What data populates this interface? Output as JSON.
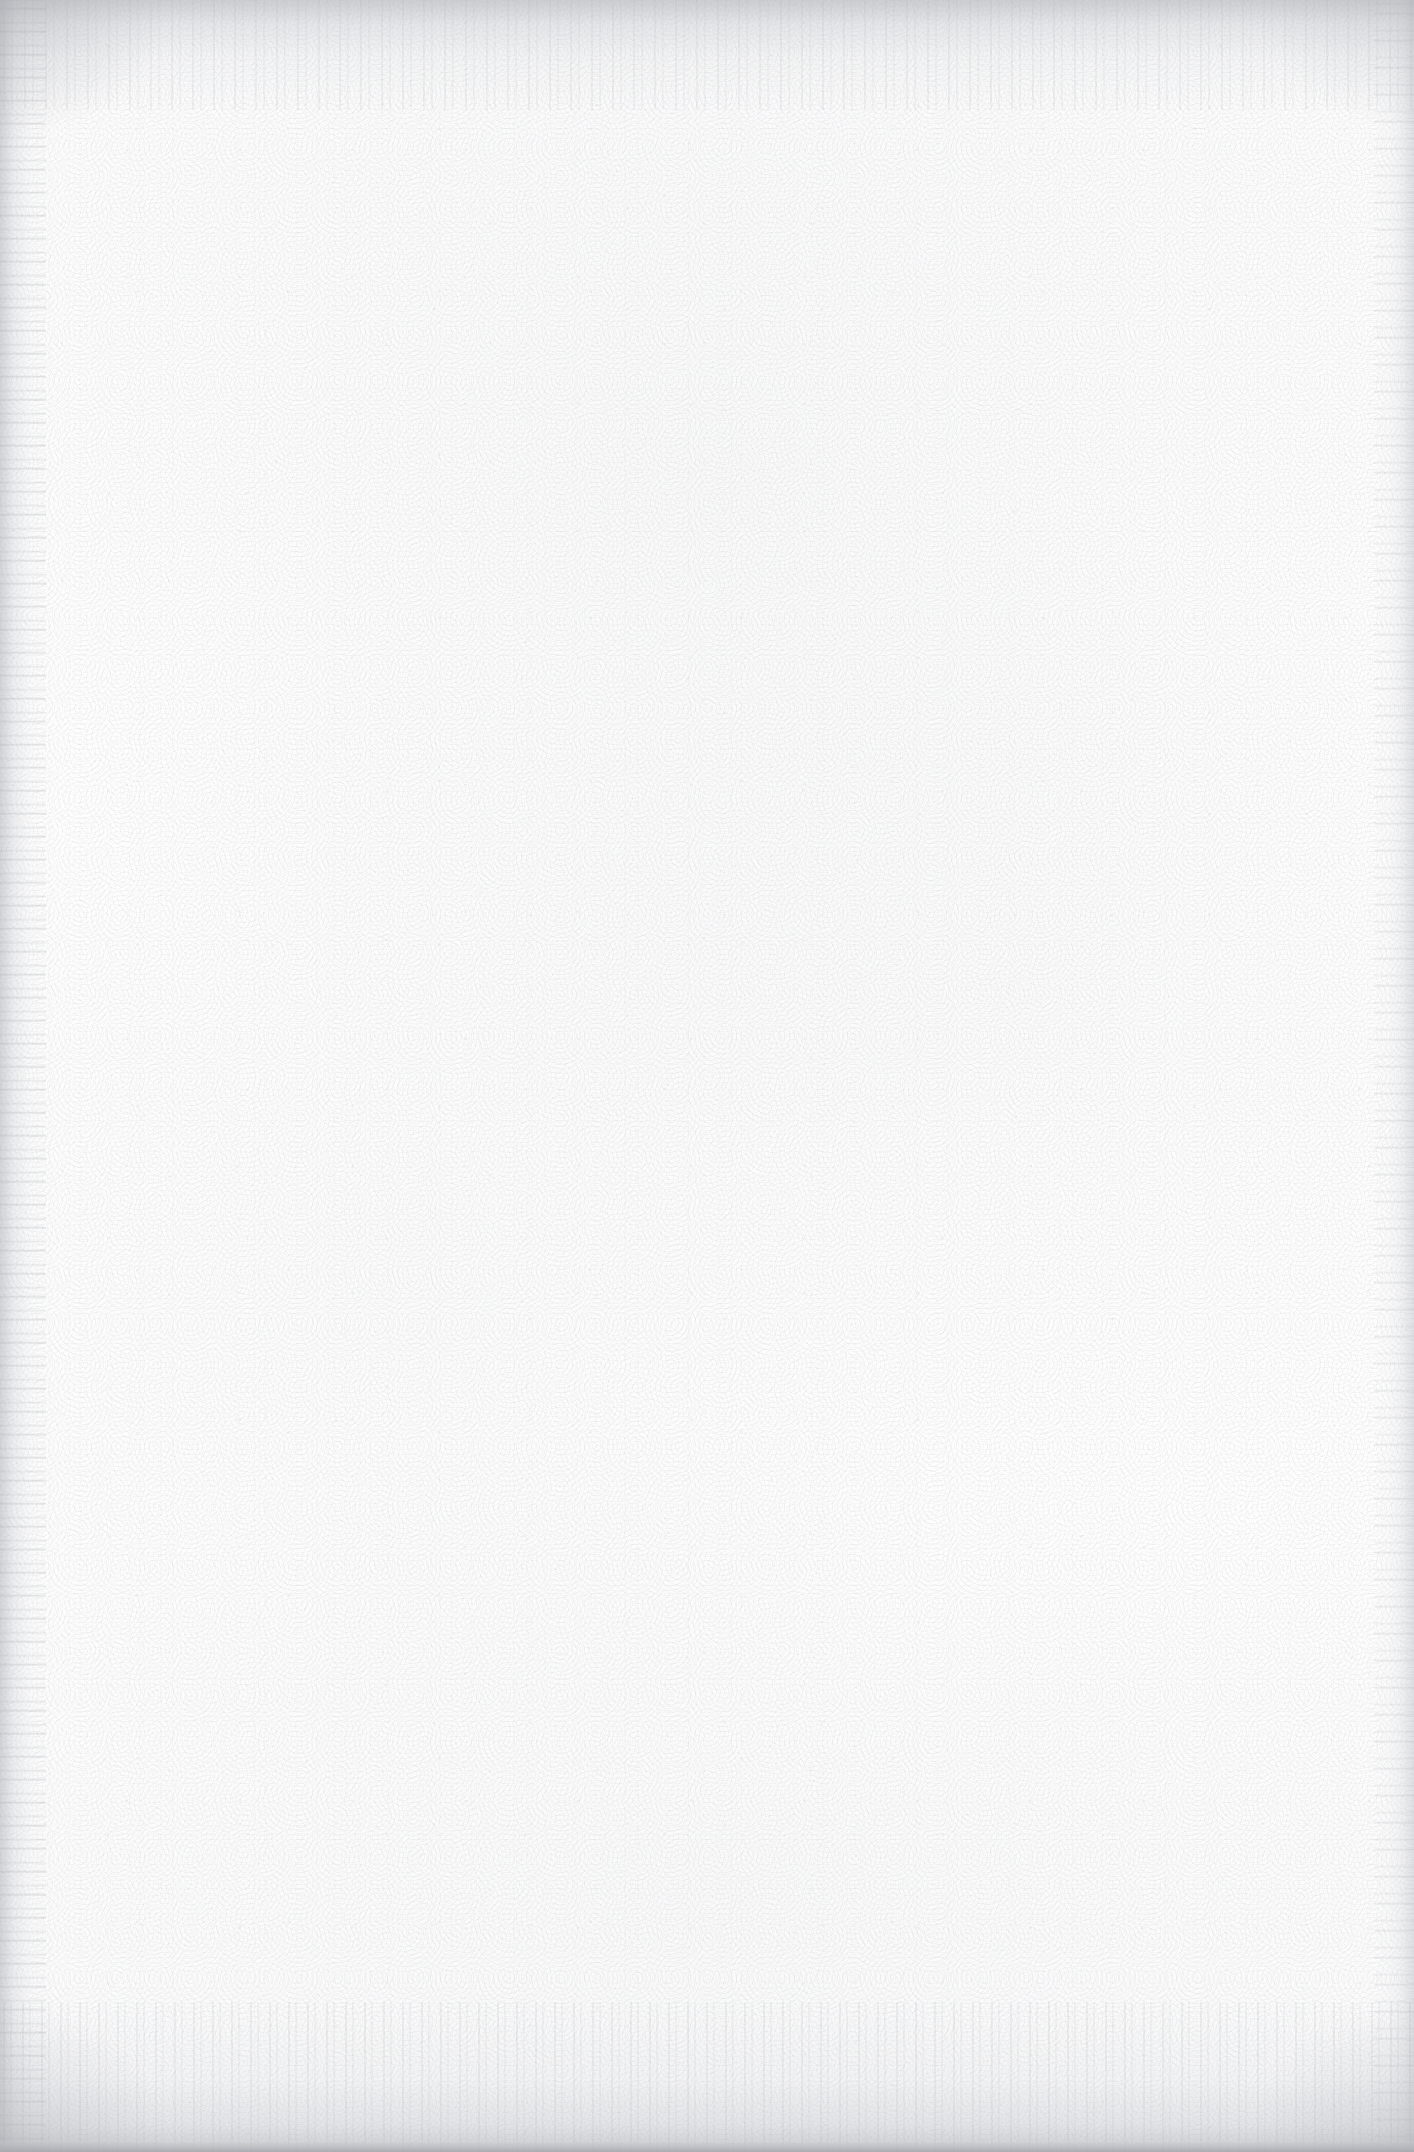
{
  "page": {
    "kind": "blank-scanned-page",
    "width": 1414,
    "height": 2152,
    "content_text": "",
    "has_printed_content": false
  },
  "colors": {
    "paper": "#fefefe",
    "grain": "#96989e",
    "edge_shadow": "#aaacb2",
    "bottom_rule": "#a8aab0"
  },
  "edges": {
    "top_band_label": "",
    "bottom_band_label": "",
    "left_band_label": "",
    "right_band_label": ""
  },
  "content": {
    "body_text": "",
    "page_number": "",
    "header": "",
    "footer": ""
  }
}
